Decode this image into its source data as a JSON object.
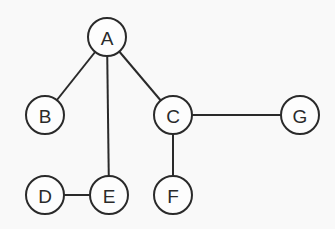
{
  "diagram": {
    "type": "graph",
    "directed": false,
    "node_radius": 19,
    "nodes": [
      {
        "id": "A",
        "label": "A",
        "x": 107,
        "y": 37
      },
      {
        "id": "B",
        "label": "B",
        "x": 45,
        "y": 115
      },
      {
        "id": "C",
        "label": "C",
        "x": 173,
        "y": 115
      },
      {
        "id": "G",
        "label": "G",
        "x": 300,
        "y": 115
      },
      {
        "id": "D",
        "label": "D",
        "x": 45,
        "y": 195
      },
      {
        "id": "E",
        "label": "E",
        "x": 109,
        "y": 195
      },
      {
        "id": "F",
        "label": "F",
        "x": 173,
        "y": 195
      }
    ],
    "edges": [
      {
        "from": "A",
        "to": "B"
      },
      {
        "from": "A",
        "to": "E"
      },
      {
        "from": "A",
        "to": "C"
      },
      {
        "from": "C",
        "to": "G"
      },
      {
        "from": "C",
        "to": "F"
      },
      {
        "from": "D",
        "to": "E"
      }
    ]
  }
}
